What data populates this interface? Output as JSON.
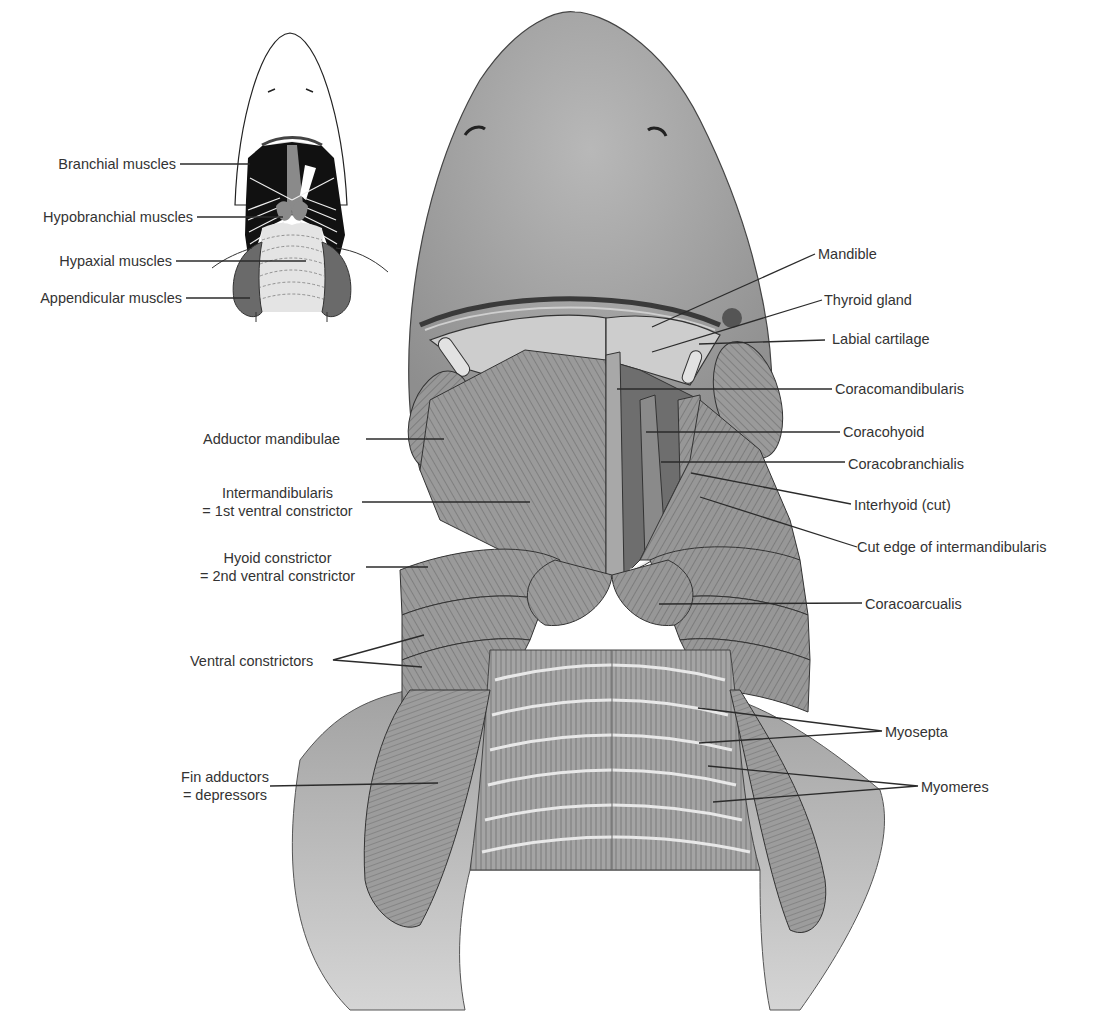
{
  "figure": {
    "inset": {
      "labels": [
        {
          "id": "branchial",
          "text": "Branchial muscles"
        },
        {
          "id": "hypobranchial",
          "text": "Hypobranchial muscles"
        },
        {
          "id": "hypaxial",
          "text": "Hypaxial muscles"
        },
        {
          "id": "appendicular",
          "text": "Appendicular muscles"
        }
      ]
    },
    "main": {
      "left_labels": [
        {
          "id": "adductor",
          "text": "Adductor mandibulae"
        },
        {
          "id": "intermandibularis",
          "line1": "Intermandibularis",
          "line2": "= 1st ventral constrictor"
        },
        {
          "id": "hyoid",
          "line1": "Hyoid constrictor",
          "line2": "= 2nd ventral constrictor"
        },
        {
          "id": "ventral",
          "text": "Ventral constrictors"
        },
        {
          "id": "fin",
          "line1": "Fin adductors",
          "line2": "= depressors"
        }
      ],
      "right_labels": [
        {
          "id": "mandible",
          "text": "Mandible"
        },
        {
          "id": "thyroid",
          "text": "Thyroid gland"
        },
        {
          "id": "labial",
          "text": "Labial cartilage"
        },
        {
          "id": "coracomandibularis",
          "text": "Coracomandibularis"
        },
        {
          "id": "coracohyoid",
          "text": "Coracohyoid"
        },
        {
          "id": "coracobranchialis",
          "text": "Coracobranchialis"
        },
        {
          "id": "interhyoid",
          "text": "Interhyoid (cut)"
        },
        {
          "id": "cutedge",
          "text": "Cut edge of intermandibularis"
        },
        {
          "id": "coracoarcualis",
          "text": "Coracoarcualis"
        },
        {
          "id": "myosepta",
          "text": "Myosepta"
        },
        {
          "id": "myomeres",
          "text": "Myomeres"
        }
      ]
    },
    "colors": {
      "branchial": "#111111",
      "hypobranchial": "#8a8a8a",
      "hypaxial": "#e2e2e2",
      "appendicular": "#6a6a6a",
      "skin": "#a9a9a9",
      "muscle": "#8f8f8f"
    }
  }
}
